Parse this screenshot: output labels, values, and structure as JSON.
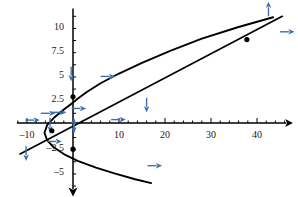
{
  "figure": {
    "title": "",
    "background_color": "#ffffff",
    "curve_color": "#000000",
    "axis_color": "#000000",
    "arrow_color": "#3f6fab",
    "point_color": "#000000",
    "width": 298,
    "height": 197
  },
  "chart_data": {
    "type": "line",
    "title": "",
    "xlabel": "",
    "ylabel": "",
    "grid": false,
    "legend": null,
    "xlim": [
      -12,
      46
    ],
    "ylim": [
      -6.5,
      11.5
    ],
    "axes": {
      "origin_px": [
        73,
        123
      ],
      "x_scale_px_per_unit": 4.6,
      "y_scale_px_per_unit": 9.7,
      "x_axis_arrow": "right",
      "y_axis_arrow": "down",
      "x_minor_tick_step": 2,
      "y_minor_tick_step": 1.25
    },
    "xticks": [
      -10,
      10,
      20,
      30,
      40
    ],
    "xtick_labels": [
      "–10",
      "10",
      "20",
      "30",
      "40"
    ],
    "yticks": [
      10,
      7.5,
      5,
      2.5,
      -2.5,
      -5
    ],
    "ytick_labels": [
      "10",
      "7.5",
      "5",
      "2.5",
      "–2.5",
      "–5"
    ],
    "series": [
      {
        "name": "parabola",
        "type": "parametric",
        "description": "sideways parabola opening to the right",
        "points": [
          [
            43.5,
            10.9
          ],
          [
            36.0,
            9.9
          ],
          [
            28.0,
            8.7
          ],
          [
            21.0,
            7.4
          ],
          [
            15.0,
            6.2
          ],
          [
            10.0,
            5.1
          ],
          [
            6.0,
            4.1
          ],
          [
            3.0,
            3.2
          ],
          [
            1.0,
            2.5
          ],
          [
            0.0,
            2.1
          ],
          [
            -2.0,
            1.4
          ],
          [
            -4.0,
            0.6
          ],
          [
            -5.6,
            -0.2
          ],
          [
            -6.2,
            -1.0
          ],
          [
            -5.6,
            -1.8
          ],
          [
            -4.2,
            -2.5
          ],
          [
            -2.0,
            -3.2
          ],
          [
            1.0,
            -3.9
          ],
          [
            5.0,
            -4.6
          ],
          [
            9.0,
            -5.2
          ],
          [
            13.5,
            -5.8
          ],
          [
            17.0,
            -6.2
          ]
        ]
      },
      {
        "name": "line",
        "type": "linear",
        "description": "straight line through the origin region with positive slope",
        "points": [
          [
            -11.5,
            -3.2
          ],
          [
            45.5,
            11.0
          ]
        ]
      }
    ],
    "marked_points": [
      {
        "x": 0.0,
        "y": 2.7,
        "label": ""
      },
      {
        "x": -4.6,
        "y": -0.8,
        "label": ""
      },
      {
        "x": 0.0,
        "y": -2.7,
        "label": ""
      },
      {
        "x": 37.8,
        "y": 8.6,
        "label": ""
      }
    ],
    "direction_arrows": [
      {
        "x": -10.4,
        "y": 0.3,
        "dir": "right"
      },
      {
        "x": -7.0,
        "y": 1.0,
        "dir": "right"
      },
      {
        "x": -4.6,
        "y": 1.1,
        "dir": "right"
      },
      {
        "x": -5.0,
        "y": 0.55,
        "dir": "down"
      },
      {
        "x": -10.2,
        "y": -2.4,
        "dir": "down"
      },
      {
        "x": -5.6,
        "y": -1.9,
        "dir": "right"
      },
      {
        "x": -0.4,
        "y": 5.8,
        "dir": "down"
      },
      {
        "x": -0.3,
        "y": 1.5,
        "dir": "right"
      },
      {
        "x": 0.2,
        "y": 0.45,
        "dir": "down"
      },
      {
        "x": 0.2,
        "y": -1.0,
        "dir": "up"
      },
      {
        "x": 6.0,
        "y": 4.8,
        "dir": "right"
      },
      {
        "x": 8.3,
        "y": 0.35,
        "dir": "right"
      },
      {
        "x": 16.0,
        "y": 2.6,
        "dir": "down"
      },
      {
        "x": 16.2,
        "y": -4.4,
        "dir": "right"
      },
      {
        "x": 42.5,
        "y": 11.0,
        "dir": "up"
      },
      {
        "x": 45.0,
        "y": 9.4,
        "dir": "right"
      }
    ]
  }
}
